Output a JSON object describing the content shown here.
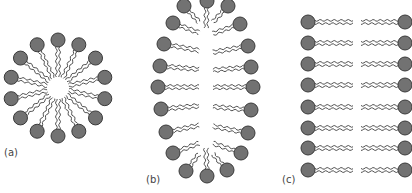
{
  "figure": {
    "colors": {
      "head_fill": "#727272",
      "head_stroke": "#3a3a3a",
      "tail_stroke": "#3c3c3c",
      "background": "#ffffff",
      "label": "#444444"
    },
    "head_radius": 7,
    "panels": [
      {
        "id": "a",
        "label": "(a)",
        "label_pos": [
          4,
          157
        ],
        "type": "spherical-micelle",
        "center": [
          58,
          88
        ],
        "head_count": 14,
        "head_orbit_radius": 48,
        "tail_inner_radius": 11
      },
      {
        "id": "b",
        "label": "(b)",
        "label_pos": [
          146,
          184
        ],
        "type": "elongated-micelle",
        "heads": [
          [
            207,
            1
          ],
          [
            184,
            6
          ],
          [
            228,
            6
          ],
          [
            173,
            23
          ],
          [
            240,
            24
          ],
          [
            164,
            44
          ],
          [
            248,
            46
          ],
          [
            160,
            66
          ],
          [
            251,
            67
          ],
          [
            158,
            87
          ],
          [
            253,
            87
          ],
          [
            161,
            109
          ],
          [
            251,
            110
          ],
          [
            166,
            132
          ],
          [
            248,
            133
          ],
          [
            173,
            153
          ],
          [
            241,
            153
          ],
          [
            186,
            171
          ],
          [
            227,
            170
          ],
          [
            207,
            176
          ]
        ],
        "core_rx": 7,
        "core_ry": 66,
        "core_center": [
          206,
          88
        ]
      },
      {
        "id": "c",
        "label": "(c)",
        "label_pos": [
          282,
          184
        ],
        "type": "bilayer",
        "rows_y": [
          22,
          43,
          64,
          85,
          107,
          128,
          148,
          170
        ],
        "left_head_x": 308,
        "right_head_x": 405,
        "left_tail_end_x": 353,
        "right_tail_start_x": 361
      }
    ]
  }
}
